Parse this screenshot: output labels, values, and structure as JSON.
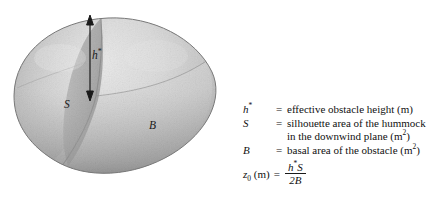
{
  "figure": {
    "caption_present": false,
    "background_color": "#ffffff",
    "ink_color": "#1a1a1a"
  },
  "diagram": {
    "name": "hummock-obstacle-3d",
    "shape_description": "teardrop ellipsoid hummock",
    "shading": {
      "body_light": "#e6e6e6",
      "body_mid": "#c9c9c9",
      "body_dark": "#9a9a9a",
      "rim_dark": "#6f6f6f",
      "plane_tint": "#b9b9b9"
    },
    "labels": {
      "height_symbol": "h",
      "height_superscript": "*",
      "silhouette_symbol": "S",
      "basal_symbol": "B"
    },
    "arrow": {
      "name": "height-dimension-arrow",
      "double_headed": true
    }
  },
  "legend": {
    "rows": [
      {
        "symbol": "h",
        "symbol_sup": "*",
        "equals": "=",
        "definition": "effective obstacle height (m)",
        "continuation": ""
      },
      {
        "symbol": "S",
        "symbol_sup": "",
        "equals": "=",
        "definition": "silhouette area of the hummock",
        "continuation_prefix": "in the downwind plane (m",
        "continuation_sup": "2",
        "continuation_suffix": ")"
      },
      {
        "symbol": "B",
        "symbol_sup": "",
        "equals": "=",
        "definition_prefix": "basal area of the obstacle (m",
        "definition_sup": "2",
        "definition_suffix": ")",
        "continuation": ""
      }
    ]
  },
  "formula": {
    "lhs_symbol": "z",
    "lhs_subscript": "0",
    "lhs_unit": "(m)",
    "equals": "=",
    "numerator": "h",
    "numerator_sup": "*",
    "numerator_tail": "S",
    "denominator": "2B"
  }
}
